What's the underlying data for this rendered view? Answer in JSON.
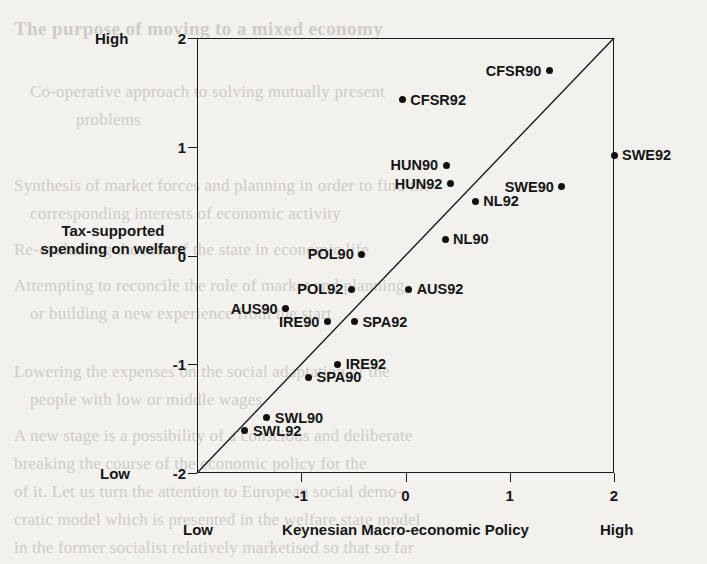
{
  "page": {
    "bleed_through_text": [
      "The purpose of moving to a mixed economy",
      "Co-operative approach to solving mutually present",
      "problems",
      "Synthesis of market forces and planning in order to find the",
      "corresponding interests of economic activity",
      "Re-evaluating the role of the state in economic life",
      "Attempting to reconcile the role of market and planning",
      "or building a new experience from the start",
      "Lowering the expenses on the social adaptation of the",
      "people with low or middle wages",
      "A new stage is a possibility of a conscious and deliberate",
      "breaking the course of the economic policy for the",
      "of it. Let us turn the attention to European social demo-",
      "cratic model which is presented in the welfare state model",
      "in the former socialist relatively marketised so that so far"
    ]
  },
  "chart_data": {
    "type": "scatter",
    "title": "",
    "xlabel": "Keynesian Macro-economic  Policy",
    "ylabel": "Tax-supported spending on welfare",
    "xlim": [
      -2,
      2
    ],
    "ylim": [
      -2,
      2
    ],
    "grid": false,
    "legend": "none",
    "x_ticks": [
      "-1",
      "0",
      "1",
      "2"
    ],
    "x_tick_values": [
      -1,
      0,
      1,
      2
    ],
    "y_ticks": [
      "2",
      "1",
      "0",
      "-1",
      "-2"
    ],
    "y_tick_values": [
      2,
      1,
      0,
      -1,
      -2
    ],
    "axis_endpoints": {
      "x_low": "Low",
      "x_high": "High",
      "y_low": "Low",
      "y_high": "High"
    },
    "reference_line": {
      "name": "45-degree diagonal",
      "from": [
        -2,
        -2
      ],
      "to": [
        2,
        2
      ]
    },
    "points": [
      {
        "label": "CFSR90",
        "x": 1.38,
        "y": 1.7,
        "label_side": "left"
      },
      {
        "label": "CFSR92",
        "x": -0.03,
        "y": 1.43,
        "label_side": "right"
      },
      {
        "label": "SWE92",
        "x": 2.0,
        "y": 0.92,
        "label_side": "right"
      },
      {
        "label": "HUN90",
        "x": 0.39,
        "y": 0.83,
        "label_side": "left"
      },
      {
        "label": "HUN92",
        "x": 0.43,
        "y": 0.66,
        "label_side": "left"
      },
      {
        "label": "SWE90",
        "x": 1.5,
        "y": 0.63,
        "label_side": "left"
      },
      {
        "label": "NL92",
        "x": 0.67,
        "y": 0.5,
        "label_side": "right"
      },
      {
        "label": "NL90",
        "x": 0.38,
        "y": 0.15,
        "label_side": "right"
      },
      {
        "label": "POL90",
        "x": -0.42,
        "y": 0.01,
        "label_side": "left"
      },
      {
        "label": "POL92",
        "x": -0.52,
        "y": -0.31,
        "label_side": "left"
      },
      {
        "label": "AUS92",
        "x": 0.03,
        "y": -0.31,
        "label_side": "right"
      },
      {
        "label": "AUS90",
        "x": -1.15,
        "y": -0.49,
        "label_side": "left"
      },
      {
        "label": "IRE90",
        "x": -0.75,
        "y": -0.61,
        "label_side": "left"
      },
      {
        "label": "SPA92",
        "x": -0.49,
        "y": -0.61,
        "label_side": "right"
      },
      {
        "label": "IRE92",
        "x": -0.65,
        "y": -1.0,
        "label_side": "right"
      },
      {
        "label": "SPA90",
        "x": -0.93,
        "y": -1.12,
        "label_side": "right"
      },
      {
        "label": "SWL90",
        "x": -1.33,
        "y": -1.49,
        "label_side": "right"
      },
      {
        "label": "SWL92",
        "x": -1.54,
        "y": -1.61,
        "label_side": "right"
      }
    ]
  }
}
